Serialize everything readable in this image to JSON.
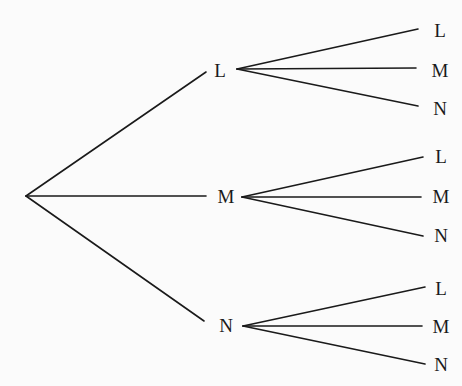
{
  "diagram": {
    "type": "probability-tree",
    "line_color": "#1a1a1a",
    "root": {
      "x": 26,
      "y": 196
    },
    "level1": [
      {
        "label": "L",
        "label_pos": {
          "x": 220,
          "y": 70
        },
        "line_end": {
          "x": 206,
          "y": 72
        },
        "branch_start": {
          "x": 237,
          "y": 69
        },
        "children": [
          {
            "label": "L",
            "label_pos": {
              "x": 440,
              "y": 30
            },
            "line_end": {
              "x": 418,
              "y": 29
            }
          },
          {
            "label": "M",
            "label_pos": {
              "x": 440,
              "y": 70
            },
            "line_end": {
              "x": 416,
              "y": 68
            }
          },
          {
            "label": "N",
            "label_pos": {
              "x": 440,
              "y": 108
            },
            "line_end": {
              "x": 418,
              "y": 106
            }
          }
        ]
      },
      {
        "label": "M",
        "label_pos": {
          "x": 226,
          "y": 196
        },
        "line_end": {
          "x": 206,
          "y": 196
        },
        "branch_start": {
          "x": 242,
          "y": 197
        },
        "children": [
          {
            "label": "L",
            "label_pos": {
              "x": 441,
              "y": 156
            },
            "line_end": {
              "x": 423,
              "y": 157
            }
          },
          {
            "label": "M",
            "label_pos": {
              "x": 441,
              "y": 196
            },
            "line_end": {
              "x": 421,
              "y": 197
            }
          },
          {
            "label": "N",
            "label_pos": {
              "x": 441,
              "y": 235
            },
            "line_end": {
              "x": 423,
              "y": 236
            }
          }
        ]
      },
      {
        "label": "N",
        "label_pos": {
          "x": 226,
          "y": 325
        },
        "line_end": {
          "x": 204,
          "y": 321
        },
        "branch_start": {
          "x": 243,
          "y": 326
        },
        "children": [
          {
            "label": "L",
            "label_pos": {
              "x": 441,
              "y": 288
            },
            "line_end": {
              "x": 425,
              "y": 287
            }
          },
          {
            "label": "M",
            "label_pos": {
              "x": 441,
              "y": 326
            },
            "line_end": {
              "x": 422,
              "y": 326
            }
          },
          {
            "label": "N",
            "label_pos": {
              "x": 441,
              "y": 364
            },
            "line_end": {
              "x": 425,
              "y": 364
            }
          }
        ]
      }
    ]
  }
}
